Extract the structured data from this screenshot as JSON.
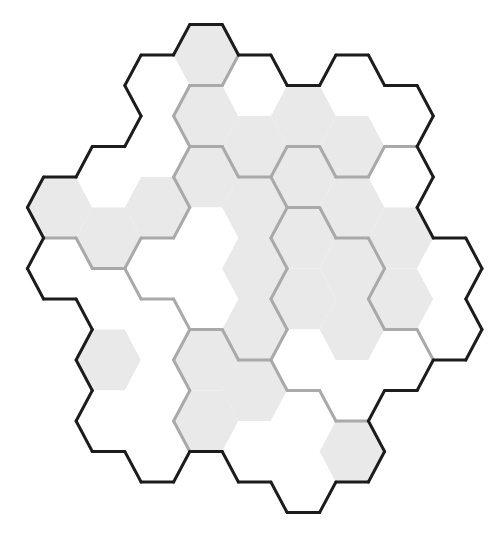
{
  "puzzle": {
    "type": "hex-region-grid",
    "orientation": "flat-top",
    "colors": {
      "shaded_cell": "#e9e9e9",
      "empty_cell": "#ffffff",
      "region_border": "#a9a9a9",
      "outer_border": "#1c1c1c"
    },
    "geometry": {
      "origin_x": 206,
      "origin_y": 55,
      "col_spacing": 48.7,
      "row_spacing": 61,
      "half_width": 32.5,
      "half_height": 30.5
    },
    "region_count": 7,
    "cells": [
      {
        "col": -3,
        "row": 2,
        "shade": "gray",
        "region": 1
      },
      {
        "col": -3,
        "row": 3,
        "shade": "white",
        "region": 7
      },
      {
        "col": -2,
        "row": 2,
        "shade": "white",
        "region": 1
      },
      {
        "col": -2,
        "row": 3,
        "shade": "gray",
        "region": 1
      },
      {
        "col": -2,
        "row": 4,
        "shade": "white",
        "region": 7
      },
      {
        "col": -2,
        "row": 5,
        "shade": "gray",
        "region": 7
      },
      {
        "col": -2,
        "row": 6,
        "shade": "white",
        "region": 7
      },
      {
        "col": -1,
        "row": 0,
        "shade": "white",
        "region": 1
      },
      {
        "col": -1,
        "row": 1,
        "shade": "white",
        "region": 1
      },
      {
        "col": -1,
        "row": 2,
        "shade": "gray",
        "region": 1
      },
      {
        "col": -1,
        "row": 3,
        "shade": "white",
        "region": 3
      },
      {
        "col": -1,
        "row": 4,
        "shade": "white",
        "region": 7
      },
      {
        "col": -1,
        "row": 5,
        "shade": "white",
        "region": 7
      },
      {
        "col": -1,
        "row": 6,
        "shade": "white",
        "region": 7
      },
      {
        "col": 0,
        "row": 0,
        "shade": "gray",
        "region": 1
      },
      {
        "col": 0,
        "row": 1,
        "shade": "gray",
        "region": 2
      },
      {
        "col": 0,
        "row": 2,
        "shade": "gray",
        "region": 3
      },
      {
        "col": 0,
        "row": 3,
        "shade": "white",
        "region": 3
      },
      {
        "col": 0,
        "row": 4,
        "shade": "white",
        "region": 3
      },
      {
        "col": 0,
        "row": 5,
        "shade": "gray",
        "region": 6
      },
      {
        "col": 0,
        "row": 6,
        "shade": "gray",
        "region": 6
      },
      {
        "col": 1,
        "row": 0,
        "shade": "white",
        "region": 2
      },
      {
        "col": 1,
        "row": 1,
        "shade": "gray",
        "region": 2
      },
      {
        "col": 1,
        "row": 2,
        "shade": "gray",
        "region": 3
      },
      {
        "col": 1,
        "row": 3,
        "shade": "gray",
        "region": 3
      },
      {
        "col": 1,
        "row": 4,
        "shade": "gray",
        "region": 3
      },
      {
        "col": 1,
        "row": 5,
        "shade": "gray",
        "region": 6
      },
      {
        "col": 1,
        "row": 6,
        "shade": "white",
        "region": 6
      },
      {
        "col": 2,
        "row": 1,
        "shade": "gray",
        "region": 2
      },
      {
        "col": 2,
        "row": 2,
        "shade": "gray",
        "region": 4
      },
      {
        "col": 2,
        "row": 3,
        "shade": "gray",
        "region": 5
      },
      {
        "col": 2,
        "row": 4,
        "shade": "gray",
        "region": 5
      },
      {
        "col": 2,
        "row": 5,
        "shade": "white",
        "region": 5
      },
      {
        "col": 2,
        "row": 6,
        "shade": "white",
        "region": 6
      },
      {
        "col": 2,
        "row": 7,
        "shade": "white",
        "region": 6
      },
      {
        "col": 3,
        "row": 0,
        "shade": "white",
        "region": 2
      },
      {
        "col": 3,
        "row": 1,
        "shade": "gray",
        "region": 2
      },
      {
        "col": 3,
        "row": 2,
        "shade": "gray",
        "region": 4
      },
      {
        "col": 3,
        "row": 3,
        "shade": "gray",
        "region": 5
      },
      {
        "col": 3,
        "row": 4,
        "shade": "gray",
        "region": 5
      },
      {
        "col": 3,
        "row": 5,
        "shade": "white",
        "region": 5
      },
      {
        "col": 3,
        "row": 6,
        "shade": "gray",
        "region": 6
      },
      {
        "col": 4,
        "row": 1,
        "shade": "white",
        "region": 2
      },
      {
        "col": 4,
        "row": 2,
        "shade": "white",
        "region": 4
      },
      {
        "col": 4,
        "row": 3,
        "shade": "gray",
        "region": 4
      },
      {
        "col": 4,
        "row": 4,
        "shade": "gray",
        "region": 4
      },
      {
        "col": 4,
        "row": 5,
        "shade": "white",
        "region": 5
      },
      {
        "col": 5,
        "row": 3,
        "shade": "white",
        "region": 4
      },
      {
        "col": 5,
        "row": 4,
        "shade": "white",
        "region": 4
      }
    ]
  }
}
